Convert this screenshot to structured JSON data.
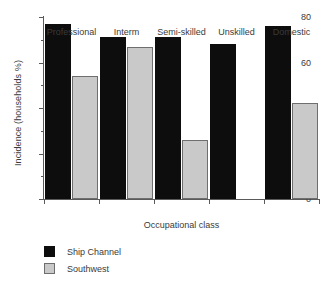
{
  "chart_data": {
    "type": "bar",
    "title": "",
    "xlabel": "Occupational class",
    "ylabel": "Incidence (households %)",
    "categories": [
      "Professional",
      "Interm",
      "Semi-skilled",
      "Unskilled",
      "Domestic"
    ],
    "series": [
      {
        "name": "Ship Channel",
        "color": "#0d0d0d",
        "values": [
          77,
          71,
          71,
          68,
          76
        ]
      },
      {
        "name": "Southwest",
        "color": "#c9c9c9",
        "values": [
          54,
          67,
          26,
          null,
          42
        ]
      }
    ],
    "ylim": [
      0,
      80
    ],
    "yticks": [
      0,
      20,
      40,
      60,
      80
    ],
    "yticks_minor": [
      10,
      30,
      50,
      70
    ],
    "ytick_labels": [
      "0",
      "20",
      "40",
      "60",
      "80"
    ],
    "grid": false,
    "legend_position": "below-left"
  },
  "legend": {
    "entries": [
      {
        "label": "Ship Channel"
      },
      {
        "label": "Southwest"
      }
    ]
  }
}
